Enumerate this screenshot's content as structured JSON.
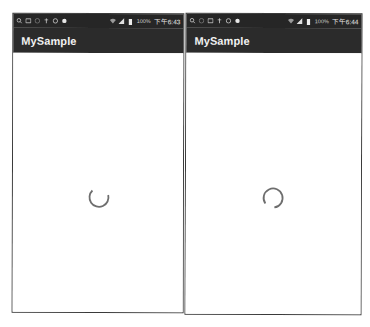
{
  "screens": [
    {
      "app_title": "MySample",
      "status_bar": {
        "left_icons": [
          "search-icon",
          "image-icon",
          "circle-icon",
          "usb-icon",
          "shield-icon",
          "bell-icon"
        ],
        "right_icons": [
          "wifi-icon",
          "signal-icon",
          "battery-icon"
        ],
        "battery": "100%",
        "time": "下午6:43"
      },
      "spinner": {
        "state": "loading",
        "arc_start_deg": 110,
        "arc_sweep_deg": 200,
        "color": "#6e6e6e"
      }
    },
    {
      "app_title": "MySample",
      "status_bar": {
        "left_icons": [
          "search-icon",
          "circle-icon",
          "image-icon",
          "usb-icon",
          "shield-icon",
          "bell-icon"
        ],
        "right_icons": [
          "wifi-icon",
          "signal-icon",
          "battery-icon"
        ],
        "battery": "100%",
        "time": "下午6:44"
      },
      "spinner": {
        "state": "loading",
        "arc_start_deg": 120,
        "arc_sweep_deg": 300,
        "color": "#6e6e6e"
      }
    }
  ],
  "colors": {
    "toolbar": "#2b2b2b",
    "status_bar": "#262626",
    "frame_border": "#3a3a3a",
    "background": "#ffffff"
  }
}
